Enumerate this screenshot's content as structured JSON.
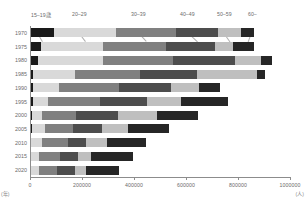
{
  "chart_data": {
    "type": "bar",
    "orientation": "horizontal",
    "stacked": true,
    "title": "",
    "xlabel": "(人)",
    "ylabel": "(年)",
    "xlim": [
      0,
      1000000
    ],
    "xticks": [
      0,
      200000,
      400000,
      600000,
      800000,
      1000000
    ],
    "xtick_labels": [
      "0",
      "200000",
      "400000",
      "600000",
      "800000",
      "1000000"
    ],
    "grid": false,
    "legend_position": "top",
    "categories": [
      "1970",
      "1975",
      "1980",
      "1985",
      "1990",
      "1995",
      "2000",
      "2005",
      "2010",
      "2015",
      "2020"
    ],
    "series": [
      {
        "name": "15–19歳",
        "color": "#1a1a1a",
        "values": [
          92000,
          42000,
          30000,
          12000,
          11000,
          11000,
          7000,
          6000,
          5000,
          5000,
          4000
        ]
      },
      {
        "name": "20–29",
        "color": "#d9d9d9",
        "values": [
          240000,
          240000,
          250000,
          160000,
          100000,
          60000,
          40000,
          50000,
          40000,
          30000,
          30000
        ]
      },
      {
        "name": "30–39",
        "color": "#808080",
        "values": [
          230000,
          240000,
          270000,
          250000,
          230000,
          200000,
          130000,
          110000,
          100000,
          80000,
          70000
        ]
      },
      {
        "name": "40–49",
        "color": "#4d4d4d",
        "values": [
          160000,
          190000,
          240000,
          220000,
          200000,
          180000,
          160000,
          110000,
          70000,
          70000,
          70000
        ]
      },
      {
        "name": "50–59",
        "color": "#bfbfbf",
        "values": [
          90000,
          70000,
          100000,
          230000,
          110000,
          130000,
          150000,
          100000,
          80000,
          50000,
          40000
        ]
      },
      {
        "name": "60–",
        "color": "#262626",
        "values": [
          50000,
          80000,
          40000,
          30000,
          80000,
          180000,
          160000,
          160000,
          150000,
          160000,
          130000
        ]
      }
    ],
    "totals": [
      862000,
      862000,
      930000,
      902000,
      732000,
      761000,
      647000,
      536000,
      445000,
      395000,
      344000
    ]
  },
  "axis": {
    "x_unit": "(人)",
    "y_unit": "(年)"
  }
}
